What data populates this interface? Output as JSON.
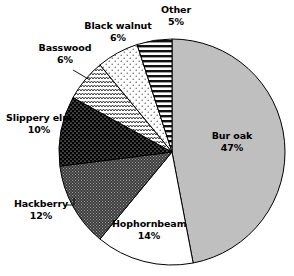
{
  "chart_data": {
    "type": "pie",
    "title": "",
    "subtitle": "",
    "xlabel": "",
    "ylabel": "",
    "legend_position": "none",
    "grid": false,
    "labels_outside": true,
    "start_angle_deg": 0,
    "direction": "clockwise",
    "categories": [
      "Bur oak",
      "Hophornbeam",
      "Hackberry",
      "Slippery elm",
      "Basswood",
      "Black walnut",
      "Other"
    ],
    "values": [
      47,
      14,
      12,
      10,
      6,
      6,
      5
    ],
    "value_unit": "%",
    "slices": [
      {
        "label": "Bur oak",
        "value": 47,
        "value_text": "47%",
        "fill": "#bfbfbf",
        "pattern": "solid-light-gray",
        "start_deg": 0,
        "end_deg": 169.2
      },
      {
        "label": "Hophornbeam",
        "value": 14,
        "value_text": "14%",
        "fill": "#ffffff",
        "pattern": "solid-white",
        "start_deg": 169.2,
        "end_deg": 219.6
      },
      {
        "label": "Hackberry",
        "value": 12,
        "value_text": "12%",
        "fill": "#4a4a4a",
        "pattern": "dark-gray-fine-dot-grid",
        "start_deg": 219.6,
        "end_deg": 262.8
      },
      {
        "label": "Slippery elm",
        "value": 10,
        "value_text": "10%",
        "fill": "#000000",
        "pattern": "black-white-dots",
        "start_deg": 262.8,
        "end_deg": 298.8
      },
      {
        "label": "Basswood",
        "value": 6,
        "value_text": "6%",
        "fill": "#ffffff",
        "pattern": "zigzag-wave",
        "start_deg": 298.8,
        "end_deg": 320.4
      },
      {
        "label": "Black walnut",
        "value": 6,
        "value_text": "6%",
        "fill": "#ffffff",
        "pattern": "sparse-stipple-dots",
        "start_deg": 320.4,
        "end_deg": 342.0
      },
      {
        "label": "Other",
        "value": 5,
        "value_text": "5%",
        "fill": "#ffffff",
        "pattern": "horizontal-stripes",
        "start_deg": 342.0,
        "end_deg": 360.0
      }
    ]
  },
  "labels": {
    "other": {
      "name": "Other",
      "value": "5%"
    },
    "black_walnut": {
      "name": "Black walnut",
      "value": "6%"
    },
    "basswood": {
      "name": "Basswood",
      "value": "6%"
    },
    "slippery_elm": {
      "name": "Slippery elm",
      "value": "10%"
    },
    "hackberry": {
      "name": "Hackberry",
      "value": "12%"
    },
    "hophornbeam": {
      "name": "Hophornbeam",
      "value": "14%"
    },
    "bur_oak": {
      "name": "Bur oak",
      "value": "47%"
    }
  },
  "colors": {
    "outline": "#000000",
    "background": "#ffffff",
    "bur_oak_fill": "#bfbfbf",
    "hackberry_fill": "#4a4a4a",
    "slippery_elm_fill": "#000000",
    "text": "#000000"
  }
}
